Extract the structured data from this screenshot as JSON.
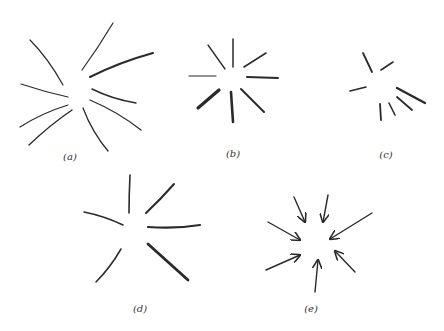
{
  "figure": {
    "stroke_color": "#2a2a2a",
    "panels": [
      {
        "id": "a",
        "label": "(a)",
        "label_pos": [
          70,
          160
        ],
        "description": "nine curved strokes radiating outward from a center",
        "strokes": [
          {
            "d": "M30,40 Q48,58 63,85",
            "w": 1.2
          },
          {
            "d": "M113,23 Q98,48 82,70",
            "w": 1.2
          },
          {
            "d": "M153,53 Q120,62 90,77",
            "w": 2.0
          },
          {
            "d": "M21,84 Q45,92 68,97",
            "w": 1.2
          },
          {
            "d": "M92,89 Q112,99 136,103",
            "w": 1.4
          },
          {
            "d": "M68,105 Q42,113 20,127",
            "w": 1.2
          },
          {
            "d": "M72,110 Q50,125 29,145",
            "w": 1.4
          },
          {
            "d": "M83,108 Q92,132 108,151",
            "w": 1.3
          },
          {
            "d": "M90,100 Q118,112 141,130",
            "w": 1.3
          }
        ]
      },
      {
        "id": "b",
        "label": "(b)",
        "label_pos": [
          233,
          157
        ],
        "description": "eight straight strokes radiating from a center, some thick",
        "strokes": [
          {
            "d": "M233,39 L233,67",
            "w": 1.5
          },
          {
            "d": "M208,45 L225,69",
            "w": 1.3
          },
          {
            "d": "M266,53 L244,67",
            "w": 1.5
          },
          {
            "d": "M189,76 L216,76",
            "w": 1.2
          },
          {
            "d": "M247,77 L278,78",
            "w": 2.0
          },
          {
            "d": "M219,90 L198,108",
            "w": 3.2
          },
          {
            "d": "M231,92 L233,122",
            "w": 2.6
          },
          {
            "d": "M241,89 L264,112",
            "w": 2.0
          }
        ]
      },
      {
        "id": "c",
        "label": "(c)",
        "label_pos": [
          386,
          158
        ],
        "description": "seven short straight strokes around a center",
        "strokes": [
          {
            "d": "M363,53 L372,72",
            "w": 1.8
          },
          {
            "d": "M393,62 L381,70",
            "w": 1.6
          },
          {
            "d": "M350,91 L366,87",
            "w": 1.6
          },
          {
            "d": "M397,88 L425,103",
            "w": 2.4
          },
          {
            "d": "M397,97 L412,110",
            "w": 1.8
          },
          {
            "d": "M389,103 L395,115",
            "w": 1.6
          },
          {
            "d": "M380,104 L381,120",
            "w": 1.8
          }
        ]
      },
      {
        "id": "d",
        "label": "(d)",
        "label_pos": [
          140,
          312
        ],
        "description": "six strokes radiating from a center",
        "strokes": [
          {
            "d": "M130,175 Q129,195 129,213",
            "w": 1.6
          },
          {
            "d": "M174,184 Q160,200 146,213",
            "w": 2.0
          },
          {
            "d": "M84,212 Q104,216 123,225",
            "w": 1.5
          },
          {
            "d": "M148,227 Q176,229 200,225",
            "w": 2.2
          },
          {
            "d": "M121,249 Q110,268 96,282",
            "w": 1.5
          },
          {
            "d": "M148,244 Q168,262 188,280",
            "w": 2.8
          }
        ]
      },
      {
        "id": "e",
        "label": "(e)",
        "label_pos": [
          311,
          312
        ],
        "description": "seven arrows pointing inward toward a center",
        "arrows": [
          {
            "x1": 294,
            "y1": 197,
            "x2": 305,
            "y2": 222
          },
          {
            "x1": 328,
            "y1": 195,
            "x2": 323,
            "y2": 222
          },
          {
            "x1": 268,
            "y1": 222,
            "x2": 300,
            "y2": 240
          },
          {
            "x1": 372,
            "y1": 213,
            "x2": 330,
            "y2": 239
          },
          {
            "x1": 266,
            "y1": 270,
            "x2": 300,
            "y2": 255
          },
          {
            "x1": 315,
            "y1": 292,
            "x2": 318,
            "y2": 260
          },
          {
            "x1": 355,
            "y1": 272,
            "x2": 335,
            "y2": 251
          }
        ]
      }
    ]
  }
}
